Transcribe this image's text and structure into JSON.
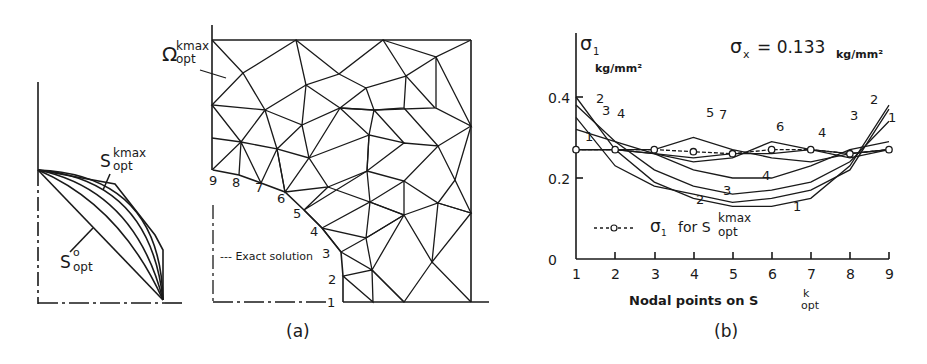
{
  "figure": {
    "panel_a": {
      "caption": "(a)",
      "shape_labels": {
        "s_kmax": "S",
        "s_kmax_sup": "kmax",
        "s_kmax_sub": "opt",
        "s_0": "S",
        "s_0_sup": "o",
        "s_0_sub": "opt",
        "omega": "Ω",
        "omega_sup": "kmax",
        "omega_sub": "opt"
      },
      "node_labels": [
        "1",
        "2",
        "3",
        "4",
        "5",
        "6",
        "7",
        "8",
        "9"
      ],
      "legend": "--- Exact solution"
    },
    "panel_b": {
      "caption": "(b)",
      "y_label": "σ",
      "y_label_sub": "1",
      "y_unit": "kg/mm²",
      "annotation": "σ",
      "annotation_sub": "x",
      "annotation_value": "= 0.133",
      "annotation_unit": "kg/mm²",
      "x_label": "Nodal points on S",
      "x_label_sup": "k",
      "x_label_sub": "opt",
      "legend_text": "for S",
      "legend_sym": "σ",
      "legend_sym_sub": "1",
      "legend_sup": "kmax",
      "legend_sub": "opt",
      "y_ticks": [
        "0",
        "0.2",
        "0.4"
      ],
      "x_ticks": [
        "1",
        "2",
        "3",
        "4",
        "5",
        "6",
        "7",
        "8",
        "9"
      ]
    }
  },
  "chart_data": {
    "type": "line",
    "xlabel": "Nodal points on S_opt^k",
    "ylabel": "σ1 (kg/mm²)",
    "x": [
      1,
      2,
      3,
      4,
      5,
      6,
      7,
      8,
      9
    ],
    "ylim": [
      0,
      0.45
    ],
    "grid": false,
    "legend_position": "lower-left",
    "series": [
      {
        "name": "1",
        "values": [
          0.35,
          0.23,
          0.18,
          0.16,
          0.14,
          0.15,
          0.17,
          0.22,
          0.37
        ]
      },
      {
        "name": "2",
        "values": [
          0.4,
          0.27,
          0.19,
          0.15,
          0.13,
          0.13,
          0.15,
          0.23,
          0.38
        ]
      },
      {
        "name": "3",
        "values": [
          0.38,
          0.29,
          0.22,
          0.18,
          0.16,
          0.17,
          0.19,
          0.24,
          0.34
        ]
      },
      {
        "name": "4",
        "values": [
          0.32,
          0.29,
          0.26,
          0.22,
          0.2,
          0.2,
          0.23,
          0.27,
          0.29
        ]
      },
      {
        "name": "5",
        "values": [
          0.27,
          0.27,
          0.27,
          0.3,
          0.27,
          0.25,
          0.24,
          0.26,
          0.27
        ]
      },
      {
        "name": "6",
        "values": [
          0.27,
          0.27,
          0.26,
          0.24,
          0.25,
          0.29,
          0.27,
          0.25,
          0.27
        ]
      },
      {
        "name": "7",
        "values": [
          0.27,
          0.27,
          0.26,
          0.25,
          0.26,
          0.26,
          0.27,
          0.26,
          0.27
        ]
      },
      {
        "name": "σ1 for S_opt^kmax",
        "values": [
          0.27,
          0.27,
          0.27,
          0.265,
          0.26,
          0.27,
          0.27,
          0.26,
          0.27
        ],
        "style": "dashed-circle-markers"
      }
    ],
    "annotations": [
      "σx = 0.133 kg/mm²"
    ]
  }
}
